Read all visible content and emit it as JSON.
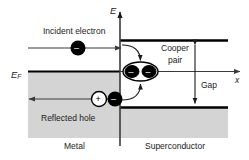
{
  "figure": {
    "type": "physics-band-diagram",
    "title_axes": {
      "energy_axis_label": "E",
      "position_axis_label": "x",
      "fermi_level_label": "E",
      "fermi_level_sub": "F"
    },
    "labels": {
      "incident_electron": "Incident electron",
      "reflected_hole": "Reflected hole",
      "cooper_pair_line1": "Cooper",
      "cooper_pair_line2": "pair",
      "gap": "Gap",
      "metal": "Metal",
      "superconductor": "Superconductor"
    },
    "particles": {
      "electron_sign": "–",
      "hole_sign": "+"
    },
    "colors": {
      "background": "#ffffff",
      "shaded_region": "#d4d4d4",
      "band_edge": "#000000",
      "line": "#3a3a3a",
      "text": "#1a1a1a",
      "electron_fill": "#000000",
      "hole_fill": "#ffffff"
    }
  }
}
